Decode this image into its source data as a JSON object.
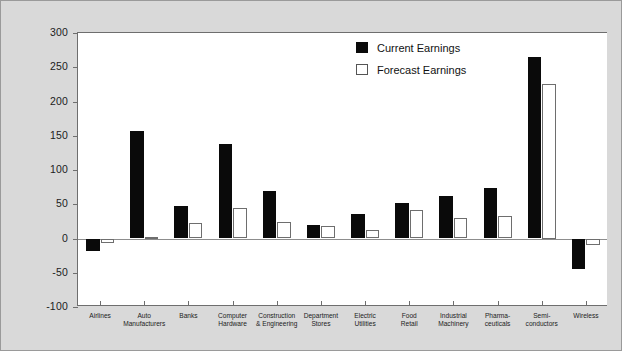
{
  "chart_data": {
    "type": "bar",
    "title": "",
    "xlabel": "",
    "ylabel": "",
    "ylim": [
      -100,
      300
    ],
    "yticks": [
      300,
      250,
      200,
      150,
      100,
      50,
      0,
      -50,
      -100
    ],
    "ytick_labels": [
      "300",
      "250",
      "200",
      "150",
      "100",
      "50",
      "0",
      "-50",
      "-100"
    ],
    "grid": false,
    "legend_position": "top-center-right",
    "categories": [
      "Airlines",
      "Auto Manufacturers",
      "Banks",
      "Computer Hardware",
      "Construction & Engineering",
      "Department Stores",
      "Electric Utilities",
      "Food Retail",
      "Industrial Machinery",
      "Pharmaceuticals",
      "Semiconductors",
      "Wireless"
    ],
    "category_label_lines": [
      [
        "Airlines"
      ],
      [
        "Auto",
        "Manufacturers"
      ],
      [
        "Banks"
      ],
      [
        "Computer",
        "Hardware"
      ],
      [
        "Construction",
        "& Engineering"
      ],
      [
        "Department",
        "Stores"
      ],
      [
        "Electric",
        "Utilities"
      ],
      [
        "Food",
        "Retail"
      ],
      [
        "Industrial",
        "Machinery"
      ],
      [
        "Pharma-",
        "ceuticals"
      ],
      [
        "Semi-",
        "conductors"
      ],
      [
        "Wireless"
      ]
    ],
    "series": [
      {
        "name": "Current Earnings",
        "color": "#0a0a0a",
        "values": [
          -18,
          157,
          47,
          138,
          70,
          20,
          36,
          52,
          62,
          74,
          265,
          -45
        ]
      },
      {
        "name": "Forecast Earnings",
        "color": "#ffffff",
        "values": [
          -6,
          2,
          22,
          44,
          24,
          18,
          13,
          41,
          30,
          33,
          225,
          -10
        ]
      }
    ]
  },
  "legend": {
    "items": [
      {
        "label": "Current Earnings",
        "swatch": "filled-black-square"
      },
      {
        "label": "Forecast Earnings",
        "swatch": "outlined-white-square"
      }
    ]
  },
  "colors": {
    "figure_background": "#d9d9d9",
    "plot_background": "#ffffff",
    "axis": "#6e6e6e",
    "current_series": "#0a0a0a",
    "forecast_series": "#ffffff",
    "text": "#1c1c1c"
  }
}
